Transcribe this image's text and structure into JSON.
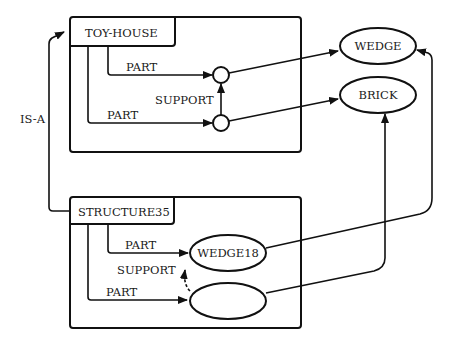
{
  "diagram": {
    "type": "semantic-network",
    "frames": [
      {
        "id": "toy-house",
        "title": "TOY-HOUSE",
        "relations": [
          {
            "label": "PART",
            "to": "part-node-top"
          },
          {
            "label": "PART",
            "to": "part-node-bottom"
          },
          {
            "label": "SUPPORT",
            "from": "part-node-bottom",
            "to": "part-node-top",
            "style": "solid"
          }
        ]
      },
      {
        "id": "structure35",
        "title": "STRUCTURE35",
        "relations": [
          {
            "label": "PART",
            "to": "WEDGE18"
          },
          {
            "label": "PART",
            "to": "BRICK12"
          },
          {
            "label": "SUPPORT",
            "from": "BRICK12",
            "to": "WEDGE18",
            "style": "dashed"
          }
        ]
      }
    ],
    "nodes": {
      "wedge": "WEDGE",
      "brick": "BRICK",
      "wedge18": "WEDGE18",
      "brick12": "BRICK12"
    },
    "labels": {
      "isa": "IS-A",
      "part": "PART",
      "support": "SUPPORT"
    },
    "edges": [
      {
        "from": "STRUCTURE35",
        "to": "TOY-HOUSE",
        "label": "IS-A"
      },
      {
        "from": "part-node-top",
        "to": "WEDGE"
      },
      {
        "from": "part-node-bottom",
        "to": "BRICK"
      },
      {
        "from": "WEDGE18",
        "to": "WEDGE"
      },
      {
        "from": "BRICK12",
        "to": "BRICK"
      }
    ]
  }
}
